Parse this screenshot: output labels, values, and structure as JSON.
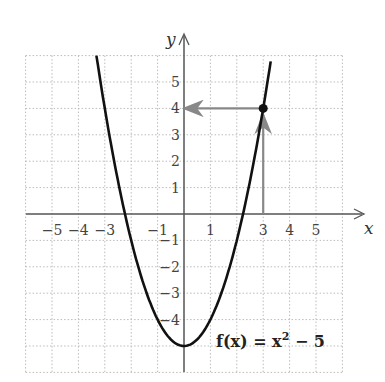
{
  "chart_data": {
    "type": "line",
    "title": "",
    "function_label": "f(x) = x² − 5",
    "function_label_parts": {
      "f": "f(x) = x",
      "sup": "2",
      "rest": " − 5"
    },
    "xlabel": "x",
    "ylabel": "y",
    "xlim": [
      -6,
      6
    ],
    "ylim": [
      -6,
      6
    ],
    "grid": true,
    "x_tick_labels": [
      "−5",
      "−4",
      "−3",
      "−1",
      "1",
      "3",
      "4",
      "5"
    ],
    "x_tick_values": [
      -5,
      -4,
      -3,
      -1,
      1,
      3,
      4,
      5
    ],
    "y_tick_labels": [
      "5",
      "4",
      "3",
      "2",
      "1",
      "−1",
      "−2",
      "−3",
      "−4"
    ],
    "y_tick_values": [
      5,
      4,
      3,
      2,
      1,
      -1,
      -2,
      -3,
      -4
    ],
    "series": [
      {
        "name": "f(x) = x^2 - 5",
        "x": [
          -3.3,
          -3,
          -2,
          -1,
          0,
          1,
          2,
          3,
          3.3
        ],
        "y": [
          5.89,
          4,
          -1,
          -4,
          -5,
          -4,
          -1,
          4,
          5.89
        ]
      }
    ],
    "highlighted_point": {
      "x": 3,
      "y": 4
    },
    "annotations": [
      {
        "type": "arrow",
        "from": [
          3,
          0
        ],
        "to": [
          3,
          4
        ],
        "color": "#888888"
      },
      {
        "type": "arrow",
        "from": [
          3,
          4
        ],
        "to": [
          0,
          4
        ],
        "color": "#888888"
      }
    ],
    "colors": {
      "curve": "#111111",
      "axis": "#555555",
      "grid": "#bbbbbb",
      "arrow": "#888888",
      "highlight_tick": "#888888"
    }
  }
}
